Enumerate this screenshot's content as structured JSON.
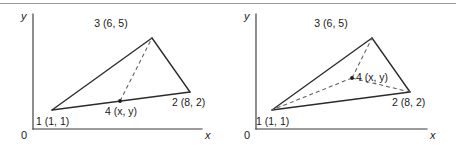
{
  "figure": {
    "panels": [
      {
        "id": "left",
        "name": "point-on-edge",
        "axis": {
          "x_label": "x",
          "y_label": "y",
          "origin_label": "0"
        },
        "vertices": [
          {
            "key": "v1",
            "label": "1 (1, 1)",
            "node": "1",
            "coords": "(1, 1)",
            "x": 1,
            "y": 1
          },
          {
            "key": "v2",
            "label": "2 (8, 2)",
            "node": "2",
            "coords": "(8, 2)",
            "x": 8,
            "y": 2
          },
          {
            "key": "v3",
            "label": "3 (6, 5)",
            "node": "3",
            "coords": "(6, 5)",
            "x": 6,
            "y": 5
          },
          {
            "key": "v4",
            "label": "4 (x, y)",
            "node": "4",
            "coords": "(x, y)",
            "x": null,
            "y": null
          }
        ],
        "solid_edges": [
          "1-2",
          "2-3",
          "3-1"
        ],
        "dashed_edges": [
          "4-3"
        ]
      },
      {
        "id": "right",
        "name": "point-inside",
        "axis": {
          "x_label": "x",
          "y_label": "y",
          "origin_label": "0"
        },
        "vertices": [
          {
            "key": "v1",
            "label": "1 (1, 1)",
            "node": "1",
            "coords": "(1, 1)",
            "x": 1,
            "y": 1
          },
          {
            "key": "v2",
            "label": "2 (8, 2)",
            "node": "2",
            "coords": "(8, 2)",
            "x": 8,
            "y": 2
          },
          {
            "key": "v3",
            "label": "3 (6, 5)",
            "node": "3",
            "coords": "(6, 5)",
            "x": 6,
            "y": 5
          },
          {
            "key": "v4",
            "label": "4 (x, y)",
            "node": "4",
            "coords": "(x, y)",
            "x": null,
            "y": null
          }
        ],
        "solid_edges": [
          "1-2",
          "2-3",
          "3-1"
        ],
        "dashed_edges": [
          "4-1",
          "4-2",
          "4-3"
        ]
      }
    ],
    "colors": {
      "stroke": "#2b2b2b",
      "dashed": "#5e5e5e",
      "axis": "#3a3a3a",
      "rule": "#9a9a9a",
      "background": "#ffffff"
    }
  }
}
